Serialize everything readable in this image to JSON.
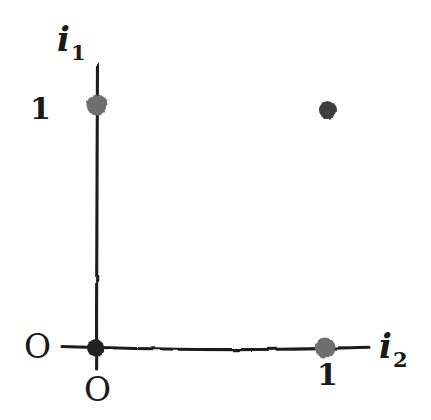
{
  "figure": {
    "kind": "hand-drawn-coordinate-axes",
    "background_color": "#ffffff",
    "ink_color": "#1f1f1f",
    "canvas": {
      "width": 431,
      "height": 420
    }
  },
  "axes": {
    "vertical": {
      "name": "i1",
      "label": "i",
      "subscript": "1",
      "label_left": 57,
      "label_top": 22,
      "x": 97,
      "y_top": 65,
      "y_bottom": 369
    },
    "horizontal": {
      "name": "i2",
      "label": "i",
      "subscript": "2",
      "label_left": 379,
      "label_top": 329,
      "y": 348,
      "x_left": 62,
      "x_right": 369
    }
  },
  "origin": {
    "label": "O",
    "x": 96,
    "y": 348,
    "dot_color": "#232323",
    "dot_radius": 9,
    "label_side_left": 38,
    "label_side_top": 332,
    "label_below_left": 86,
    "label_below_top": 375
  },
  "tick_labels": {
    "vertical_one": {
      "text": "1",
      "left": 30,
      "top": 94
    },
    "horizontal_one": {
      "text": "1",
      "left": 317,
      "top": 360
    }
  },
  "points": [
    {
      "name": "unit-point-vertical",
      "x": 97,
      "y": 105,
      "radius": 11,
      "color": "#6e6e6e",
      "on_axis": "vertical"
    },
    {
      "name": "unit-point-horizontal",
      "x": 325,
      "y": 348,
      "radius": 11,
      "color": "#6e6e6e",
      "on_axis": "horizontal"
    },
    {
      "name": "free-point-upper-right",
      "x": 328,
      "y": 110,
      "radius": 9,
      "color": "#3c3c3c",
      "on_axis": "none"
    }
  ]
}
